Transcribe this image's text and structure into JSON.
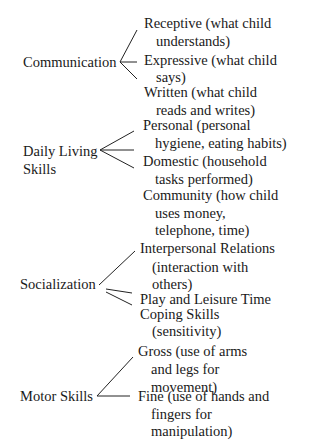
{
  "domains": [
    {
      "name": "Communication",
      "subdomains": [
        {
          "line1": "Receptive (what child",
          "line2": "understands)"
        },
        {
          "line1": "Expressive (what child",
          "line2": "says)"
        },
        {
          "line1": "Written (what child",
          "line2": "reads and writes)"
        }
      ]
    },
    {
      "name_line1": "Daily Living",
      "name_line2": "Skills",
      "subdomains": [
        {
          "line1": "Personal (personal",
          "line2": "hygiene, eating habits)"
        },
        {
          "line1": "Domestic (household",
          "line2": "tasks performed)"
        },
        {
          "line1": "Community (how child",
          "line2": "uses money,",
          "line3": "telephone, time)"
        }
      ]
    },
    {
      "name": "Socialization",
      "subdomains": [
        {
          "line1": "Interpersonal Relations",
          "line2": "(interaction with",
          "line3": "others)"
        },
        {
          "line1": "Play and Leisure Time"
        },
        {
          "line1": "Coping Skills",
          "line2": "(sensitivity)"
        }
      ]
    },
    {
      "name": "Motor Skills",
      "subdomains": [
        {
          "line1": "Gross (use of arms",
          "line2": "and legs for",
          "line3": "movement)"
        },
        {
          "line1": "Fine (use of hands and",
          "line2": "fingers for",
          "line3": "manipulation)"
        }
      ]
    }
  ]
}
